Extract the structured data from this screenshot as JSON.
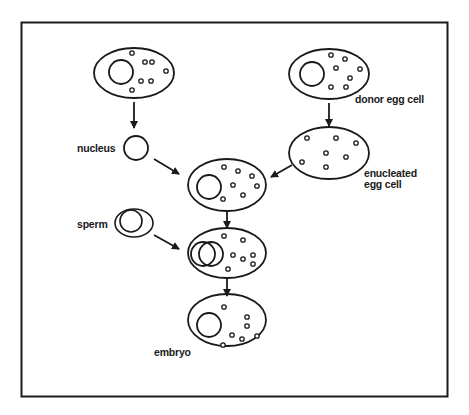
{
  "diagram": {
    "frame": {
      "x": 21,
      "y": 22,
      "width": 427,
      "height": 375,
      "stroke": "#1a1a1a"
    },
    "labels": {
      "donor_egg_cell": "donor egg cell",
      "nucleus": "nucleus",
      "enucleated_line1": "enucleated",
      "enucleated_line2": "egg cell",
      "sperm": "sperm",
      "embryo": "embryo"
    },
    "nodes": [
      {
        "id": "body-cell",
        "label": "",
        "cx": 134,
        "cy": 73,
        "rx": 40,
        "ry": 25,
        "has_nucleus": true
      },
      {
        "id": "donor-egg-cell",
        "label": "donor egg cell",
        "cx": 329,
        "cy": 74,
        "rx": 40,
        "ry": 25,
        "has_nucleus": true
      },
      {
        "id": "nucleus",
        "label": "nucleus",
        "cx": 136,
        "cy": 148,
        "r": 12
      },
      {
        "id": "enucleated-egg-cell",
        "label": "enucleated egg cell",
        "cx": 329,
        "cy": 153,
        "rx": 40,
        "ry": 26,
        "has_nucleus": false
      },
      {
        "id": "reconstructed-cell",
        "label": "",
        "cx": 227,
        "cy": 185,
        "rx": 39,
        "ry": 26,
        "has_nucleus": true
      },
      {
        "id": "sperm",
        "label": "sperm",
        "cx": 134,
        "cy": 223
      },
      {
        "id": "fertilized-cell",
        "label": "",
        "cx": 227,
        "cy": 253,
        "rx": 39,
        "ry": 25,
        "has_nucleus": true
      },
      {
        "id": "embryo",
        "label": "embryo",
        "cx": 227,
        "cy": 320,
        "rx": 39,
        "ry": 26,
        "has_nucleus": true
      }
    ],
    "edges": [
      {
        "from": "body-cell",
        "to": "nucleus"
      },
      {
        "from": "donor-egg-cell",
        "to": "enucleated-egg-cell"
      },
      {
        "from": "nucleus",
        "to": "reconstructed-cell"
      },
      {
        "from": "enucleated-egg-cell",
        "to": "reconstructed-cell"
      },
      {
        "from": "reconstructed-cell",
        "to": "fertilized-cell"
      },
      {
        "from": "sperm",
        "to": "fertilized-cell"
      },
      {
        "from": "fertilized-cell",
        "to": "embryo"
      }
    ]
  }
}
